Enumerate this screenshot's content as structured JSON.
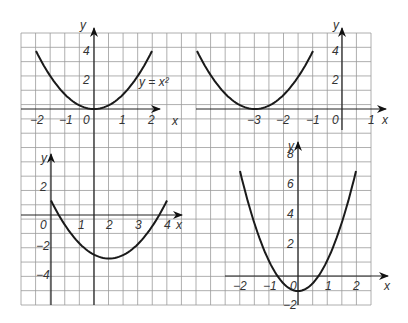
{
  "grid": {
    "x0": 21,
    "y0": 33,
    "x1": 371,
    "y1": 305,
    "cols": 24,
    "rows": 19,
    "line_color": "#9a9a9a"
  },
  "chart_data": [
    {
      "type": "line",
      "name": "top-left",
      "function": "y = x^2",
      "annotation": "y = x²",
      "x_range": [
        -2,
        2
      ],
      "x": [
        -2,
        -1,
        0,
        1,
        2
      ],
      "y": [
        4,
        1,
        0,
        1,
        4
      ],
      "x_ticks": [
        "−2",
        "−1",
        "0",
        "1",
        "2"
      ],
      "y_ticks": [
        "2",
        "4"
      ],
      "xlabel": "x",
      "ylabel": "y",
      "origin_px": [
        94,
        109
      ],
      "unit_px": [
        29,
        14.5
      ]
    },
    {
      "type": "line",
      "name": "top-right",
      "function": "y = (x+3)^2",
      "x_range": [
        -5,
        -1
      ],
      "x": [
        -5,
        -4,
        -3,
        -2,
        -1
      ],
      "y": [
        4,
        1,
        0,
        1,
        4
      ],
      "x_ticks": [
        "−3",
        "−2",
        "−1",
        "0",
        "1"
      ],
      "y_ticks": [
        "2",
        "4"
      ],
      "xlabel": "x",
      "ylabel": "y",
      "origin_px": [
        342,
        109
      ],
      "unit_px": [
        29,
        14.5
      ]
    },
    {
      "type": "line",
      "name": "bottom-left",
      "function": "y = (x-2)^2 - 3",
      "x_range": [
        0,
        4
      ],
      "x": [
        0,
        1,
        2,
        3,
        4
      ],
      "y": [
        1,
        -2,
        -3,
        -2,
        1
      ],
      "x_ticks": [
        "0",
        "1",
        "2",
        "3",
        "4"
      ],
      "y_ticks": [
        "2",
        "−2",
        "−4"
      ],
      "xlabel": "x",
      "ylabel": "y",
      "origin_px": [
        51,
        215
      ],
      "unit_px": [
        29,
        14.5
      ]
    },
    {
      "type": "line",
      "name": "bottom-right",
      "function": "y = 2x^2 - 1",
      "x_range": [
        -2,
        2
      ],
      "x": [
        -2,
        -1,
        0,
        1,
        2
      ],
      "y": [
        7,
        1,
        -1,
        1,
        7
      ],
      "x_ticks": [
        "−2",
        "−1",
        "0",
        "1",
        "2"
      ],
      "y_ticks": [
        "8",
        "6",
        "4",
        "2",
        "−2"
      ],
      "xlabel": "x",
      "ylabel": "y",
      "origin_px": [
        298,
        276
      ],
      "unit_px": [
        29,
        15
      ]
    }
  ],
  "labels": {
    "tl": {
      "y": "y",
      "x": "x",
      "y4": "4",
      "y2": "2",
      "xm2": "−2",
      "xm1": "−1",
      "x0": "0",
      "x1": "1",
      "x2": "2",
      "eq": "y = x²"
    },
    "tr": {
      "y": "y",
      "x": "x",
      "y4": "4",
      "y2": "2",
      "xm3": "−3",
      "xm2": "−2",
      "xm1": "−1",
      "x0": "0",
      "x1": "1"
    },
    "bl": {
      "y": "y",
      "x": "x",
      "y2": "2",
      "ym2": "−2",
      "ym4": "−4",
      "x0": "0",
      "x1": "1",
      "x2": "2",
      "x3": "3",
      "x4": "4"
    },
    "br": {
      "y": "y",
      "x": "x",
      "y8": "8",
      "y6": "6",
      "y4": "4",
      "y2": "2",
      "ym2": "−2",
      "xm2": "−2",
      "xm1": "−1",
      "x0": "0",
      "x1": "1",
      "x2": "2"
    }
  }
}
